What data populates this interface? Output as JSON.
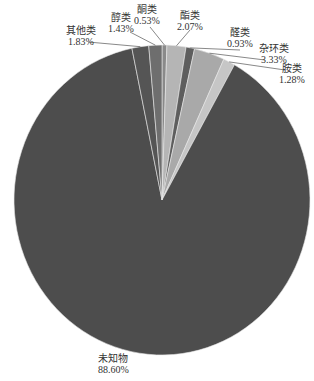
{
  "chart_data": {
    "type": "pie",
    "title": "",
    "start_angle": "12 o'clock",
    "direction": "clockwise",
    "slices": [
      {
        "name": "酮类",
        "value": 0.53,
        "label": "0.53%",
        "color": "#8a8a8a"
      },
      {
        "name": "酯类",
        "value": 2.07,
        "label": "2.07%",
        "color": "#b5b5b5"
      },
      {
        "name": "醛类",
        "value": 0.93,
        "label": "0.93%",
        "color": "#5e5e5e"
      },
      {
        "name": "杂环类",
        "value": 3.33,
        "label": "3.33%",
        "color": "#a9a9a9"
      },
      {
        "name": "胺类",
        "value": 1.28,
        "label": "1.28%",
        "color": "#c6c6c6"
      },
      {
        "name": "未知物",
        "value": 88.6,
        "label": "88.60%",
        "color": "#4d4d4d"
      },
      {
        "name": "其他类",
        "value": 1.83,
        "label": "1.83%",
        "color": "#555555"
      },
      {
        "name": "醇类",
        "value": 1.43,
        "label": "1.43%",
        "color": "#6e6e6e"
      }
    ],
    "legend": "none (leader-line labels)"
  }
}
